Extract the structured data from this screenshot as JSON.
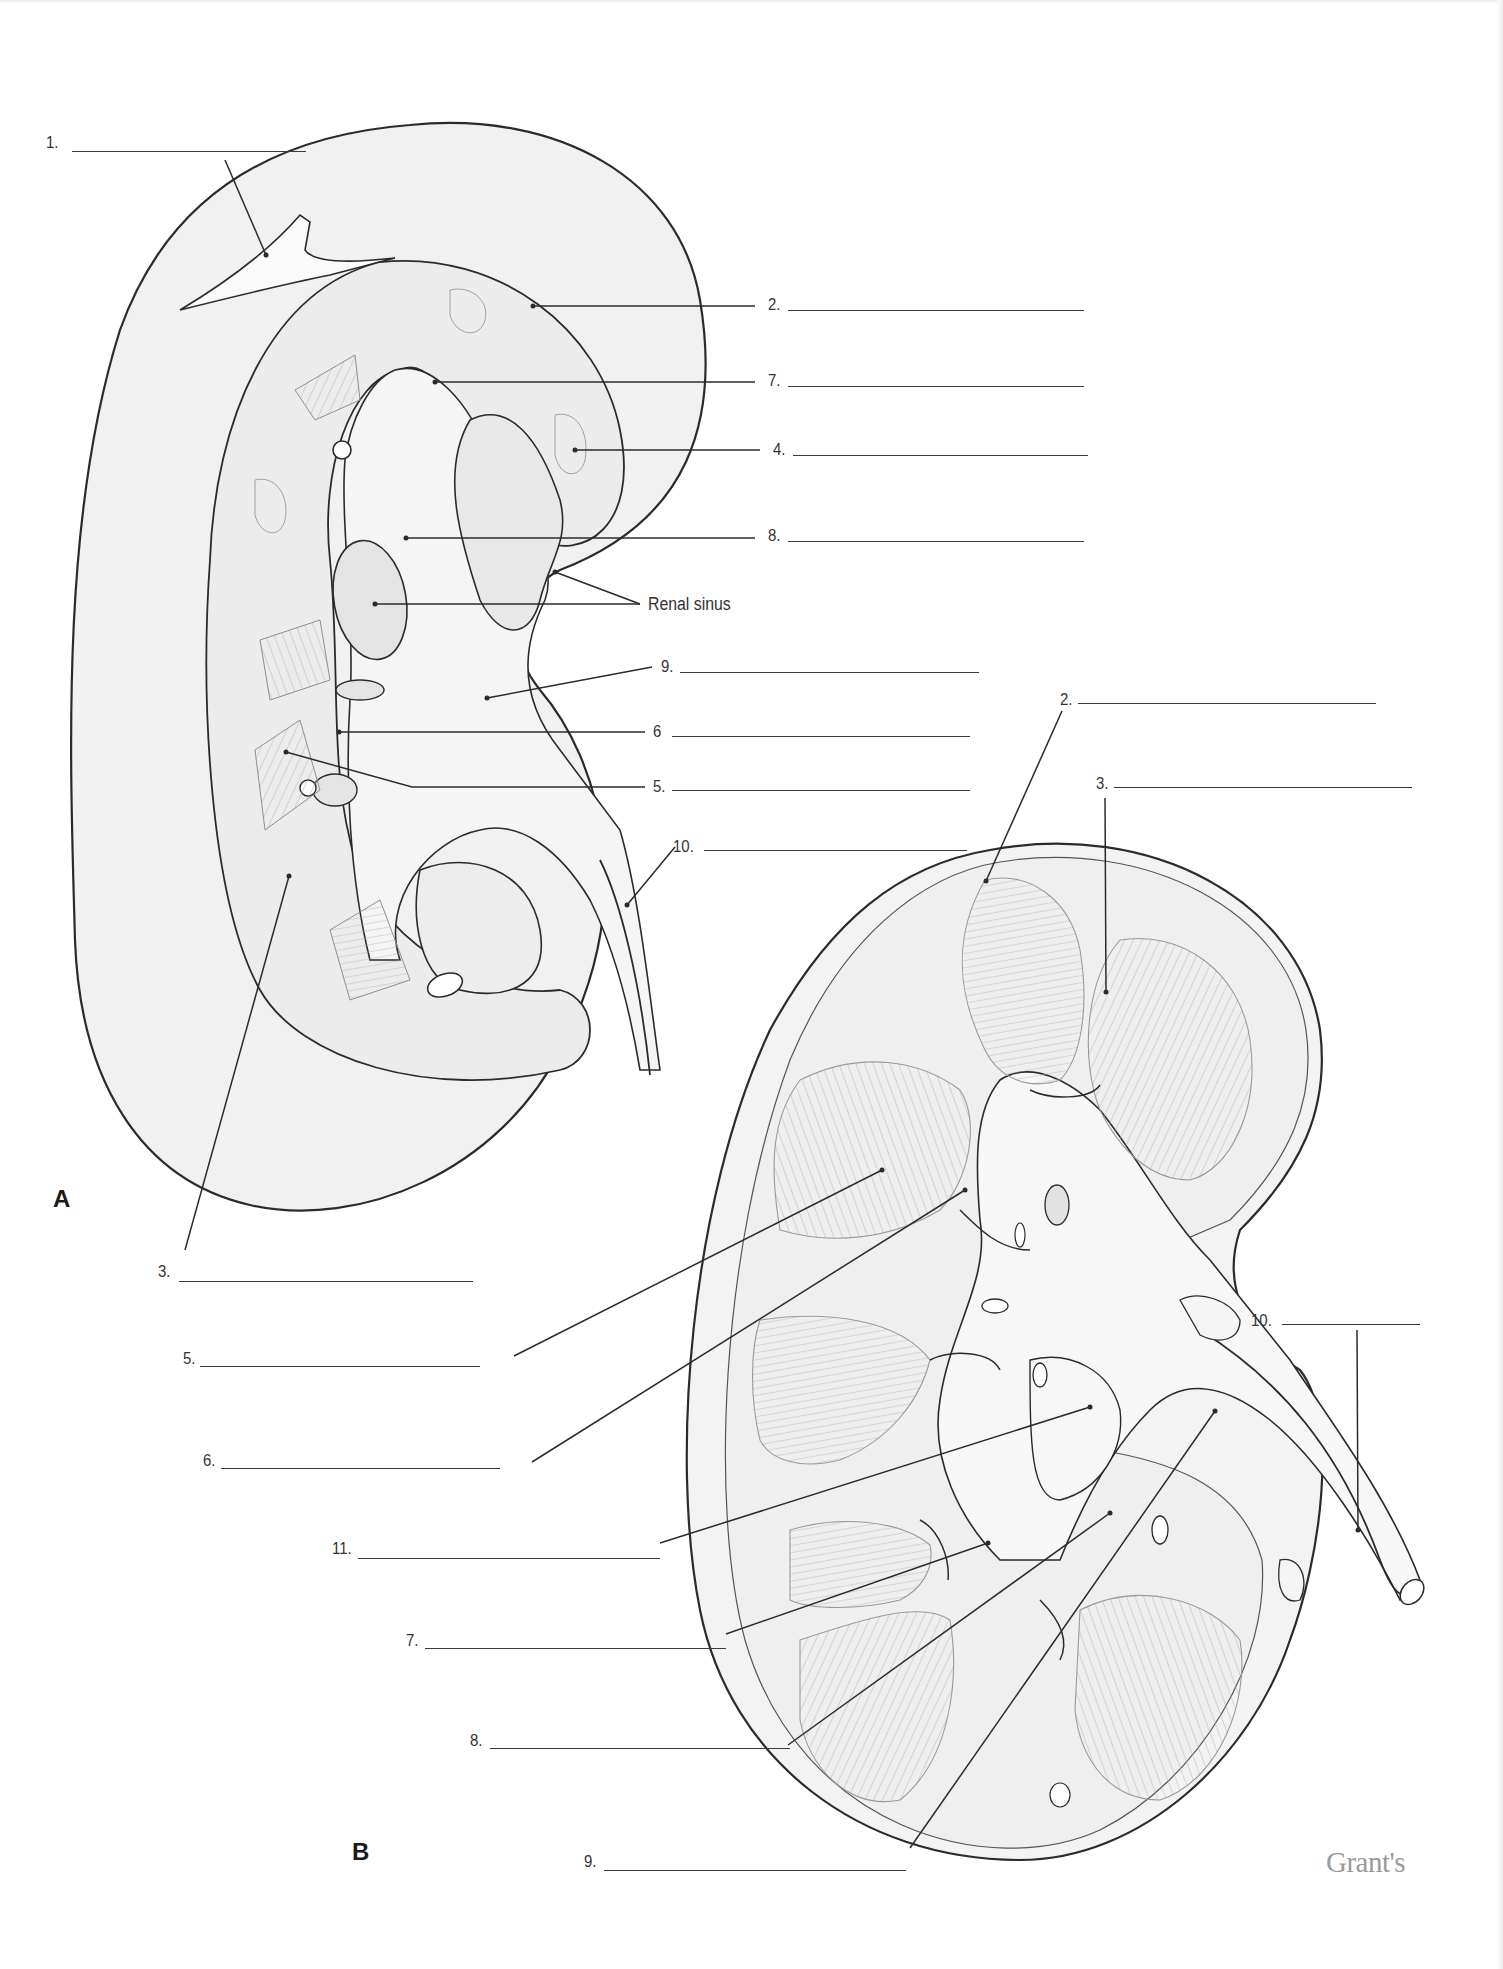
{
  "figure": {
    "publisher_mark": "Grant's",
    "panels": [
      {
        "id": "A",
        "letter": "A",
        "labels": [
          {
            "number": "1.",
            "answer": ""
          },
          {
            "number": "2.",
            "answer": ""
          },
          {
            "number": "7.",
            "answer": ""
          },
          {
            "number": "4.",
            "answer": ""
          },
          {
            "number": "8.",
            "answer": ""
          },
          {
            "number": "9.",
            "answer": ""
          },
          {
            "number": "6",
            "answer": ""
          },
          {
            "number": "5.",
            "answer": ""
          },
          {
            "number": "10.",
            "answer": ""
          },
          {
            "number": "3.",
            "answer": ""
          }
        ],
        "given_label": "Renal sinus"
      },
      {
        "id": "B",
        "letter": "B",
        "labels": [
          {
            "number": "2.",
            "answer": ""
          },
          {
            "number": "3.",
            "answer": ""
          },
          {
            "number": "10.",
            "answer": ""
          },
          {
            "number": "5.",
            "answer": ""
          },
          {
            "number": "6.",
            "answer": ""
          },
          {
            "number": "11.",
            "answer": ""
          },
          {
            "number": "7.",
            "answer": ""
          },
          {
            "number": "8.",
            "answer": ""
          },
          {
            "number": "9.",
            "answer": ""
          }
        ]
      }
    ]
  },
  "colors": {
    "line": "#2b2b2b",
    "tissue_fill": "#f0f0f0",
    "sinus_fill": "#e6e6e6",
    "pyramid_stroke": "#9a9a9a",
    "brand": "#9a9a9a"
  }
}
